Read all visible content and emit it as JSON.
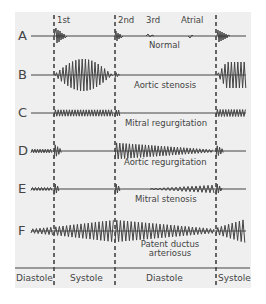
{
  "figure": {
    "markers": {
      "first": "1st",
      "second": "2nd",
      "third": "3rd",
      "atrial": "Atrial"
    },
    "rows": [
      {
        "letter": "A",
        "caption": "Normal"
      },
      {
        "letter": "B",
        "caption": "Aortic stenosis"
      },
      {
        "letter": "C",
        "caption": "Mitral regurgitation"
      },
      {
        "letter": "D",
        "caption": "Aortic regurgitation"
      },
      {
        "letter": "E",
        "caption": "Mitral stenosis"
      },
      {
        "letter": "F",
        "caption_line1": "Patent ductus",
        "caption_line2": "arteriosus"
      }
    ],
    "phases": [
      "Diastole",
      "Systole",
      "Diastole",
      "Systole"
    ],
    "colors": {
      "background": "#efefef",
      "line": "#444444",
      "outer": "#ffffff"
    }
  }
}
